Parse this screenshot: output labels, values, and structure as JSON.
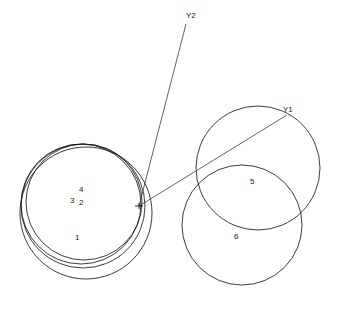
{
  "figure": {
    "background_color": "#ffffff",
    "stroke_color": "#1a1a1a",
    "axis_stroke_color": "#3a3a3a",
    "width": 337,
    "height": 321,
    "convergence_point": {
      "x": 139,
      "y": 206
    },
    "left_crossing_point": {
      "x": 22,
      "y": 216
    }
  },
  "chart_data": {
    "type": "scatter",
    "xlabel": "",
    "ylabel": "",
    "grid": false,
    "legend": "none",
    "xlim": [
      0,
      337
    ],
    "ylim": [
      0,
      321
    ],
    "circles": [
      {
        "label": "1",
        "cx": 86,
        "cy": 213,
        "r": 66
      },
      {
        "label": "2",
        "cx": 83,
        "cy": 206,
        "r": 62
      },
      {
        "label": "3",
        "cx": 81,
        "cy": 204,
        "r": 60
      },
      {
        "label": "4",
        "cx": 84,
        "cy": 202,
        "r": 58
      },
      {
        "label": "5",
        "cx": 258,
        "cy": 168,
        "r": 62
      },
      {
        "label": "6",
        "cx": 242,
        "cy": 225,
        "r": 60
      }
    ],
    "rays": [
      {
        "label": "Y1",
        "x1": 139,
        "y1": 206,
        "x2": 287,
        "y2": 115
      },
      {
        "label": "Y2",
        "x1": 139,
        "y1": 206,
        "x2": 186,
        "y2": 24
      }
    ],
    "point_labels": [
      {
        "text": "1",
        "x": 75,
        "y": 234
      },
      {
        "text": "2",
        "x": 79,
        "y": 199
      },
      {
        "text": "3",
        "x": 70,
        "y": 197
      },
      {
        "text": "4",
        "x": 79,
        "y": 186
      },
      {
        "text": "5",
        "x": 250,
        "y": 178
      },
      {
        "text": "6",
        "x": 234,
        "y": 233
      },
      {
        "text": "Y1",
        "x": 283,
        "y": 106
      },
      {
        "text": "Y2",
        "x": 186,
        "y": 12
      }
    ]
  }
}
